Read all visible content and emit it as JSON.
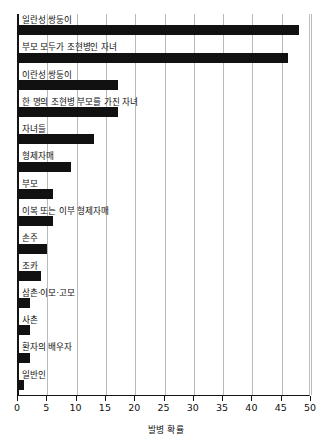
{
  "chart_data": {
    "type": "bar",
    "orientation": "horizontal",
    "title": "",
    "xlabel": "발병 확률",
    "ylabel": "",
    "xlim": [
      0,
      50
    ],
    "xticks": [
      0,
      5,
      10,
      15,
      20,
      25,
      30,
      35,
      40,
      45,
      50
    ],
    "xtick_labels": [
      "0",
      "5",
      "10",
      "15",
      "20",
      "25",
      "30",
      "35",
      "40",
      "45",
      "50"
    ],
    "grid": true,
    "grid_axis": "x",
    "legend": false,
    "bar_color": "#111111",
    "categories": [
      "일란성 쌍둥이",
      "부모 모두가 조현병인 자녀",
      "이란성 쌍둥이",
      "한 명의 조현병 부모를 가진 자녀",
      "자녀들",
      "형제자매",
      "부모",
      "이복 또는 이부 형제자매",
      "손주",
      "조카",
      "삼촌·이모·고모",
      "사촌",
      "환자의 배우자",
      "일반인"
    ],
    "values": [
      48,
      46,
      17,
      17,
      13,
      9,
      6,
      6,
      5,
      4,
      2,
      2,
      2,
      1
    ]
  }
}
